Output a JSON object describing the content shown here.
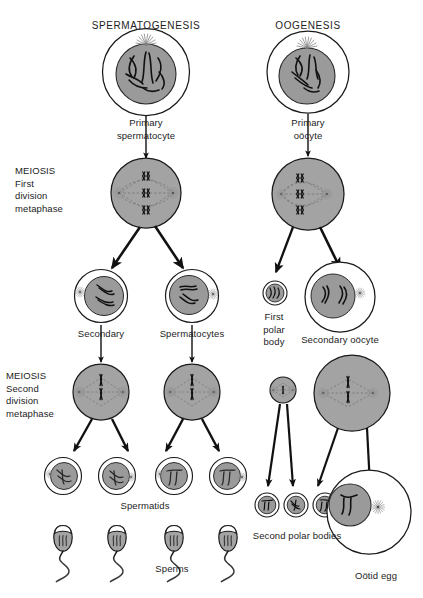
{
  "figure": {
    "type": "biology-diagram",
    "columns": [
      {
        "id": "spermatogenesis",
        "title": "SPERMATOGENESIS"
      },
      {
        "id": "oogenesis",
        "title": "OOGENESIS"
      }
    ],
    "stage_labels": {
      "meiosis_first": "MEIOSIS\nFirst\ndivision\nmetaphase",
      "meiosis_second": "MEIOSIS\nSecond\ndivision\nmetaphase"
    },
    "titles": {
      "spermatogenesis": "SPERMATOGENESIS",
      "oogenesis": "OOGENESIS"
    },
    "labels": {
      "primary_spermatocyte": "Primary\nspermatocyte",
      "primary_oocyte": "Primary\noöcyte",
      "secondary": "Secondary",
      "spermatocytes": "Spermatocytes",
      "first_polar_body": "First\npolar\nbody",
      "secondary_oocyte": "Secondary oöcyte",
      "spermatids": "Spermatids",
      "sperms": "Sperms",
      "second_polar_bodies": "Second polar bodies",
      "ootid_egg": "Oötid egg"
    },
    "colors": {
      "cytoplasm_fill": "#ffffff",
      "nucleus_fill": "#9a9a9a",
      "cell_fill_gray": "#a3a3a3",
      "outline": "#1a1a1a",
      "chromosome": "#1a1a1a",
      "spindle": "#555555",
      "background": "#ffffff",
      "text": "#1d1d1d"
    },
    "cells": {
      "primary_spermatocyte": {
        "count": 1,
        "chromosome_sets": 4,
        "note": "diploid, large nucleus with 4 bivalent chromosomes"
      },
      "primary_oocyte": {
        "count": 1,
        "chromosome_sets": 4,
        "note": "diploid, large nucleus"
      },
      "meiosis_I_male": {
        "count": 1,
        "tetrads": 3,
        "spindle": "central symmetric"
      },
      "meiosis_I_female": {
        "count": 1,
        "tetrads": 3,
        "spindle": "eccentric, displaced to one pole"
      },
      "secondary_spermatocytes": {
        "count": 2
      },
      "first_polar_body_cell": {
        "count": 1
      },
      "secondary_oocyte_cell": {
        "count": 1
      },
      "meiosis_II_male": {
        "count": 2,
        "spindle": "central symmetric"
      },
      "meiosis_II_female": {
        "count": 1,
        "spindle": "eccentric"
      },
      "meiosis_II_polar_body": {
        "count": 1
      },
      "spermatids": {
        "count": 4
      },
      "sperms": {
        "count": 4
      },
      "second_polar_bodies": {
        "count": 3
      },
      "ootid_egg_cell": {
        "count": 1
      }
    },
    "flow": [
      {
        "from": "primary_spermatocyte",
        "to": "meiosis_I_male"
      },
      {
        "from": "meiosis_I_male",
        "to": "secondary_spermatocytes",
        "arrows": 2
      },
      {
        "from": "secondary_spermatocytes",
        "to": "meiosis_II_male",
        "arrows": 2
      },
      {
        "from": "meiosis_II_male",
        "to": "spermatids",
        "arrows": 4
      },
      {
        "from": "spermatids",
        "to": "sperms",
        "arrows": 4
      },
      {
        "from": "primary_oocyte",
        "to": "meiosis_I_female"
      },
      {
        "from": "meiosis_I_female",
        "to": "first_polar_body_cell",
        "arrows": 1
      },
      {
        "from": "meiosis_I_female",
        "to": "secondary_oocyte_cell",
        "arrows": 1
      },
      {
        "from": "meiosis_II_polar_body",
        "to": "second_polar_bodies",
        "arrows": 2
      },
      {
        "from": "meiosis_II_female",
        "to": "second_polar_bodies",
        "arrows": 1
      },
      {
        "from": "meiosis_II_female",
        "to": "ootid_egg_cell",
        "arrows": 1
      }
    ]
  }
}
